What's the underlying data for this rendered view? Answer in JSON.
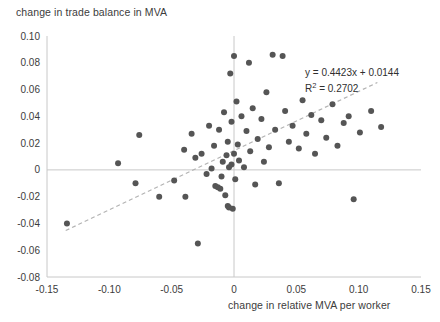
{
  "chart_data": {
    "type": "scatter",
    "title": "change in trade balance in MVA",
    "xlabel": "change in relative MVA per worker",
    "ylabel": "",
    "xlim": [
      -0.15,
      0.15
    ],
    "ylim": [
      -0.08,
      0.1
    ],
    "xticks": [
      "-0.15",
      "-0.10",
      "-0.05",
      "0",
      "0.05",
      "0.10",
      "0.15"
    ],
    "xtick_values": [
      -0.15,
      -0.1,
      -0.05,
      0,
      0.05,
      0.1,
      0.15
    ],
    "yticks": [
      "0.10",
      "0.08",
      "0.06",
      "0.04",
      "0.02",
      "0",
      "-0.02",
      "-0.04",
      "-0.06",
      "-0.08"
    ],
    "ytick_values": [
      0.1,
      0.08,
      0.06,
      0.04,
      0.02,
      0,
      -0.02,
      -0.04,
      -0.06,
      -0.08
    ],
    "grid": false,
    "legend": "none",
    "annotations": {
      "equation": "y = 0.4423x + 0.0144",
      "r_squared_label": "R",
      "r_squared_exponent": "2",
      "r_squared_value": " = 0.2702"
    },
    "trendline": {
      "slope": 0.4423,
      "intercept": 0.0144,
      "style": "dashed",
      "color": "#b3b3b3",
      "x_start": -0.135,
      "x_end": 0.115
    },
    "marker": {
      "color": "#555555",
      "size": 4.2,
      "shape": "circle"
    },
    "axis_color": "#c8c8c8",
    "zero_line_color": "#c8c8c8",
    "points": [
      [
        -0.134,
        -0.04
      ],
      [
        -0.093,
        0.005
      ],
      [
        -0.079,
        -0.01
      ],
      [
        -0.076,
        0.026
      ],
      [
        -0.06,
        -0.02
      ],
      [
        -0.048,
        -0.008
      ],
      [
        -0.04,
        0.015
      ],
      [
        -0.039,
        -0.02
      ],
      [
        -0.034,
        0.027
      ],
      [
        -0.031,
        0.009
      ],
      [
        -0.029,
        -0.055
      ],
      [
        -0.026,
        0.012
      ],
      [
        -0.022,
        -0.003
      ],
      [
        -0.02,
        0.033
      ],
      [
        -0.018,
        0.001
      ],
      [
        -0.016,
        0.018
      ],
      [
        -0.015,
        -0.012
      ],
      [
        -0.013,
        -0.013
      ],
      [
        -0.012,
        0.03
      ],
      [
        -0.011,
        -0.014
      ],
      [
        -0.01,
        -0.005
      ],
      [
        -0.009,
        0.006
      ],
      [
        -0.008,
        0.043
      ],
      [
        -0.007,
        -0.019
      ],
      [
        -0.006,
        0.011
      ],
      [
        -0.005,
        0.021
      ],
      [
        -0.005,
        -0.027
      ],
      [
        -0.004,
        0.002
      ],
      [
        -0.004,
        -0.028
      ],
      [
        -0.003,
        0.072
      ],
      [
        -0.002,
        0.036
      ],
      [
        -0.002,
        0.004
      ],
      [
        -0.001,
        -0.029
      ],
      [
        0.0,
        0.085
      ],
      [
        0.0,
        0.012
      ],
      [
        0.001,
        -0.007
      ],
      [
        0.002,
        0.051
      ],
      [
        0.003,
        0.019
      ],
      [
        0.004,
        0.007
      ],
      [
        0.006,
        0.04
      ],
      [
        0.008,
        0.002
      ],
      [
        0.01,
        0.029
      ],
      [
        0.012,
        0.08
      ],
      [
        0.013,
        0.014
      ],
      [
        0.015,
        0.046
      ],
      [
        0.017,
        -0.011
      ],
      [
        0.019,
        0.023
      ],
      [
        0.022,
        0.038
      ],
      [
        0.024,
        0.006
      ],
      [
        0.026,
        0.058
      ],
      [
        0.028,
        0.017
      ],
      [
        0.031,
        0.086
      ],
      [
        0.033,
        0.03
      ],
      [
        0.036,
        -0.01
      ],
      [
        0.039,
        0.085
      ],
      [
        0.041,
        0.044
      ],
      [
        0.044,
        0.021
      ],
      [
        0.047,
        0.033
      ],
      [
        0.052,
        0.016
      ],
      [
        0.055,
        0.052
      ],
      [
        0.058,
        0.027
      ],
      [
        0.062,
        0.041
      ],
      [
        0.065,
        0.012
      ],
      [
        0.07,
        0.037
      ],
      [
        0.074,
        0.024
      ],
      [
        0.079,
        0.049
      ],
      [
        0.083,
        0.018
      ],
      [
        0.088,
        0.035
      ],
      [
        0.092,
        0.04
      ],
      [
        0.096,
        -0.022
      ],
      [
        0.101,
        0.028
      ],
      [
        0.11,
        0.044
      ],
      [
        0.118,
        0.032
      ]
    ]
  }
}
